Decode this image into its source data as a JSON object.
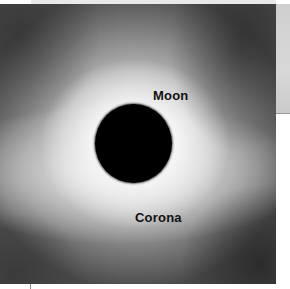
{
  "figure": {
    "labels": {
      "moon": "Moon",
      "corona": "Corona"
    },
    "colors": {
      "moon_disk": "#000000",
      "corona_bright": "#ffffff",
      "background_dark": "#3e3e3e",
      "label_text": "#111111"
    }
  }
}
